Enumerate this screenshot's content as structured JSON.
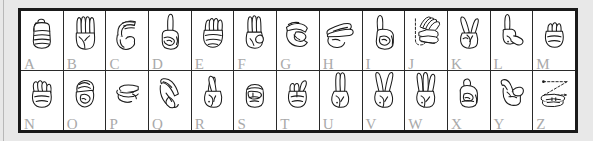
{
  "chart": {
    "colors": {
      "page_background": "#e8e8e8",
      "frame_border": "#1a1a1a",
      "grid_line": "#2a2a2a",
      "cell_background": "#ffffff",
      "letter_label": "#a9a9a9",
      "hand_outline": "#1a1a1a"
    },
    "layout": {
      "columns": 13,
      "rows": 2
    },
    "rows": [
      {
        "name": "row-top",
        "cells": [
          {
            "letter": "A",
            "icon": "asl-hand-a-icon",
            "description": "closed fist, thumb at side"
          },
          {
            "letter": "B",
            "icon": "asl-hand-b-icon",
            "description": "flat hand, fingers up, thumb across palm"
          },
          {
            "letter": "C",
            "icon": "asl-hand-c-icon",
            "description": "curved hand forming a C shape"
          },
          {
            "letter": "D",
            "icon": "asl-hand-d-icon",
            "description": "index finger up, other fingers touch thumb"
          },
          {
            "letter": "E",
            "icon": "asl-hand-e-icon",
            "description": "fingers curled down onto thumb"
          },
          {
            "letter": "F",
            "icon": "asl-hand-f-icon",
            "description": "thumb and index touching, three fingers up"
          },
          {
            "letter": "G",
            "icon": "asl-hand-g-icon",
            "description": "index finger and thumb pointing sideways"
          },
          {
            "letter": "H",
            "icon": "asl-hand-h-icon",
            "description": "index and middle finger extended sideways"
          },
          {
            "letter": "I",
            "icon": "asl-hand-i-icon",
            "description": "pinky finger extended upward"
          },
          {
            "letter": "J",
            "icon": "asl-hand-j-icon",
            "description": "pinky extended tracing a J motion",
            "motion": "dashed hook arc"
          },
          {
            "letter": "K",
            "icon": "asl-hand-k-icon",
            "description": "index and middle up in V, thumb between"
          },
          {
            "letter": "L",
            "icon": "asl-hand-l-icon",
            "description": "index up and thumb out forming an L"
          },
          {
            "letter": "M",
            "icon": "asl-hand-m-icon",
            "description": "thumb tucked under three fingers"
          }
        ]
      },
      {
        "name": "row-bottom",
        "cells": [
          {
            "letter": "N",
            "icon": "asl-hand-n-icon",
            "description": "thumb tucked under two fingers"
          },
          {
            "letter": "O",
            "icon": "asl-hand-o-icon",
            "description": "fingers and thumb form an O shape"
          },
          {
            "letter": "P",
            "icon": "asl-hand-p-icon",
            "description": "K shape pointed downward"
          },
          {
            "letter": "Q",
            "icon": "asl-hand-q-icon",
            "description": "G shape pointed downward"
          },
          {
            "letter": "R",
            "icon": "asl-hand-r-icon",
            "description": "index and middle finger crossed"
          },
          {
            "letter": "S",
            "icon": "asl-hand-s-icon",
            "description": "fist with thumb across front of fingers"
          },
          {
            "letter": "T",
            "icon": "asl-hand-t-icon",
            "description": "thumb between index and middle finger"
          },
          {
            "letter": "U",
            "icon": "asl-hand-u-icon",
            "description": "index and middle finger together, pointing up"
          },
          {
            "letter": "V",
            "icon": "asl-hand-v-icon",
            "description": "index and middle finger apart in a V"
          },
          {
            "letter": "W",
            "icon": "asl-hand-w-icon",
            "description": "index, middle and ring fingers up"
          },
          {
            "letter": "X",
            "icon": "asl-hand-x-icon",
            "description": "index finger bent into a hook"
          },
          {
            "letter": "Y",
            "icon": "asl-hand-y-icon",
            "description": "thumb and pinky extended"
          },
          {
            "letter": "Z",
            "icon": "asl-hand-z-icon",
            "description": "index finger tracing a Z motion",
            "motion": "dashed zigzag with arrow"
          }
        ]
      }
    ]
  }
}
